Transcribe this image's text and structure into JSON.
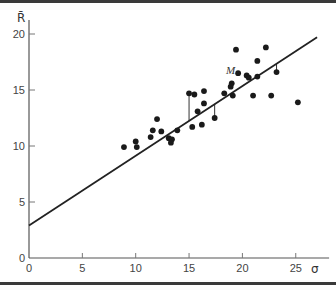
{
  "chart_data": {
    "type": "scatter",
    "title": "",
    "xlabel": "σ",
    "ylabel": "R̄",
    "xlim": [
      0,
      27
    ],
    "ylim": [
      0,
      21
    ],
    "x_ticks": [
      0,
      5,
      10,
      15,
      20,
      25
    ],
    "y_ticks": [
      0,
      5,
      10,
      15,
      20
    ],
    "grid": false,
    "legend": null,
    "series": [
      {
        "name": "portfolios",
        "type": "scatter",
        "points": [
          [
            8.9,
            9.9
          ],
          [
            10.0,
            10.4
          ],
          [
            10.1,
            9.9
          ],
          [
            11.4,
            10.8
          ],
          [
            11.6,
            11.4
          ],
          [
            12.0,
            12.4
          ],
          [
            12.4,
            11.3
          ],
          [
            13.1,
            10.7
          ],
          [
            13.4,
            10.6
          ],
          [
            13.3,
            10.3
          ],
          [
            13.9,
            11.4
          ],
          [
            15.0,
            14.7
          ],
          [
            15.5,
            14.6
          ],
          [
            16.4,
            14.9
          ],
          [
            16.4,
            13.8
          ],
          [
            15.8,
            13.1
          ],
          [
            15.3,
            11.7
          ],
          [
            16.2,
            11.9
          ],
          [
            17.4,
            12.5
          ],
          [
            18.3,
            14.7
          ],
          [
            19.0,
            15.6
          ],
          [
            18.9,
            15.3
          ],
          [
            19.1,
            14.5
          ],
          [
            19.4,
            18.6
          ],
          [
            19.6,
            16.5
          ],
          [
            20.4,
            16.3
          ],
          [
            20.6,
            16.1
          ],
          [
            21.4,
            16.2
          ],
          [
            21.4,
            17.6
          ],
          [
            22.2,
            18.8
          ],
          [
            21.0,
            14.5
          ],
          [
            22.7,
            14.5
          ],
          [
            23.2,
            16.6
          ],
          [
            25.2,
            13.9
          ]
        ]
      },
      {
        "name": "regression line",
        "type": "line",
        "x": [
          0,
          27
        ],
        "y": [
          2.9,
          19.7
        ]
      }
    ],
    "residual_lines_for": [
      [
        13.9,
        11.4
      ],
      [
        15.0,
        14.7
      ],
      [
        17.4,
        12.5
      ],
      [
        23.2,
        16.6
      ]
    ],
    "annotations": [
      {
        "text": "M",
        "x": 19.6,
        "y": 16.5,
        "note": "market portfolio"
      }
    ]
  },
  "labels": {
    "x_axis": "σ",
    "y_axis": "R̄",
    "annotation_m": "M"
  }
}
